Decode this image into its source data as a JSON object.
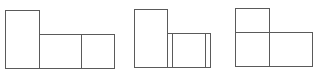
{
  "diagram": {
    "stroke_color": "#5a5a5a",
    "background": "#ffffff",
    "figures": [
      {
        "name": "figure-1",
        "parts": [
          "tall-box",
          "middle-box",
          "right-box"
        ]
      },
      {
        "name": "figure-2",
        "parts": [
          "tall-box",
          "wide-box-with-inner-lines"
        ]
      },
      {
        "name": "figure-3",
        "parts": [
          "top-box",
          "bottom-left-box",
          "bottom-right-box"
        ]
      }
    ]
  }
}
